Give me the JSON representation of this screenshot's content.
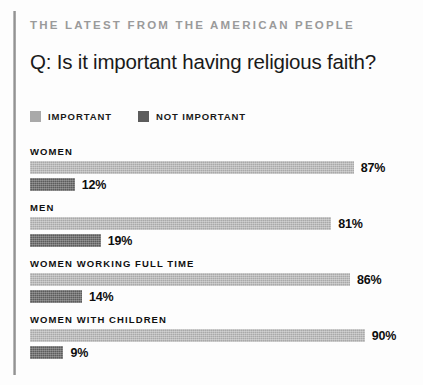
{
  "kicker": "THE LATEST FROM THE AMERICAN PEOPLE",
  "headline": "Q: Is it important having religious faith?",
  "legend": [
    {
      "label": "IMPORTANT",
      "swatch": "light-gray-swatch-icon",
      "color": "#a9a9a9"
    },
    {
      "label": "NOT IMPORTANT",
      "swatch": "dark-gray-swatch-icon",
      "color": "#5c5c5c"
    }
  ],
  "groups": [
    {
      "label": "WOMEN",
      "important": {
        "value": 87,
        "text": "87%"
      },
      "not_important": {
        "value": 12,
        "text": "12%"
      }
    },
    {
      "label": "MEN",
      "important": {
        "value": 81,
        "text": "81%"
      },
      "not_important": {
        "value": 19,
        "text": "19%"
      }
    },
    {
      "label": "WOMEN WORKING FULL TIME",
      "important": {
        "value": 86,
        "text": "86%"
      },
      "not_important": {
        "value": 14,
        "text": "14%"
      }
    },
    {
      "label": "WOMEN WITH CHILDREN",
      "important": {
        "value": 90,
        "text": "90%"
      },
      "not_important": {
        "value": 9,
        "text": "9%"
      }
    }
  ],
  "chart_data": {
    "type": "bar",
    "orientation": "horizontal",
    "title": "Q: Is it important having religious faith?",
    "subtitle": "THE LATEST FROM THE AMERICAN PEOPLE",
    "xlabel": "",
    "ylabel": "",
    "xlim": [
      0,
      100
    ],
    "grid": false,
    "legend_position": "top-left",
    "units": "percent",
    "categories": [
      "WOMEN",
      "MEN",
      "WOMEN WORKING FULL TIME",
      "WOMEN WITH CHILDREN"
    ],
    "series": [
      {
        "name": "IMPORTANT",
        "color": "#a9a9a9",
        "values": [
          87,
          81,
          86,
          90
        ]
      },
      {
        "name": "NOT IMPORTANT",
        "color": "#5c5c5c",
        "values": [
          12,
          19,
          14,
          9
        ]
      }
    ],
    "data_labels": [
      {
        "category": "WOMEN",
        "IMPORTANT": "87%",
        "NOT IMPORTANT": "12%"
      },
      {
        "category": "MEN",
        "IMPORTANT": "81%",
        "NOT IMPORTANT": "19%"
      },
      {
        "category": "WOMEN WORKING FULL TIME",
        "IMPORTANT": "86%",
        "NOT IMPORTANT": "14%"
      },
      {
        "category": "WOMEN WITH CHILDREN",
        "IMPORTANT": "90%",
        "NOT IMPORTANT": "9%"
      }
    ]
  },
  "scale": {
    "px_per_percent": 3.72
  }
}
